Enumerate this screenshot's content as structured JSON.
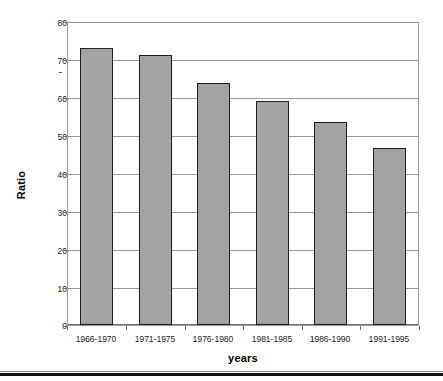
{
  "chart_data": {
    "type": "bar",
    "title": "",
    "xlabel": "years",
    "ylabel": "Ratio",
    "categories": [
      "1966-1970",
      "1971-1975",
      "1976-1980",
      "1981-1985",
      "1986-1990",
      "1991-1995"
    ],
    "values": [
      73.5,
      71.5,
      64.0,
      59.3,
      53.7,
      47.0
    ],
    "ylim": [
      0,
      80
    ],
    "ytick_labels": [
      "0",
      "10",
      "20",
      "30",
      "40",
      "50",
      "60",
      "70",
      "80"
    ],
    "ytick_values": [
      0,
      10,
      20,
      30,
      40,
      50,
      60,
      70,
      80
    ],
    "grid": "horizontal",
    "legend": "none",
    "series": [
      {
        "name": "Ratio",
        "values": [
          73.5,
          71.5,
          64.0,
          59.3,
          53.7,
          47.0
        ],
        "bar_fill_color": "#a3a3a3",
        "bar_border_color": "#1c1c1c"
      }
    ],
    "gridline_color": "#9b9b9b",
    "axis_color": "#6e6e6e",
    "background_color": "#ffffff"
  }
}
